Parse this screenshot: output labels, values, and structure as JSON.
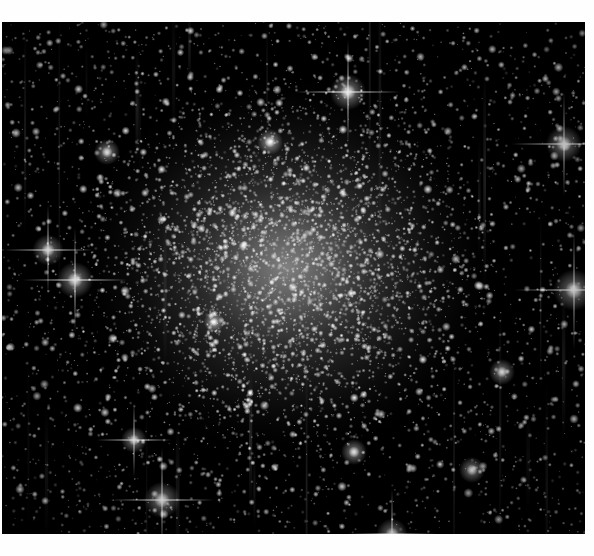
{
  "viewer": {
    "width": 594,
    "height": 556,
    "background_color": "#ffffff",
    "margin_top_px": 22,
    "margin_left_px": 2,
    "margin_right_px": 9,
    "margin_bottom_px": 22,
    "top_caption": "",
    "bottom_caption": ""
  },
  "image": {
    "title": "Globular Star Cluster Core",
    "subject": "globular-cluster",
    "palette": "monochrome-grayscale",
    "frame_x": 2,
    "frame_y": 22,
    "frame_width": 583,
    "frame_height": 512,
    "background_color": "#000000",
    "star_color": "#ffffff",
    "halo_color": "#c8c8c8",
    "core": {
      "center_x": 285,
      "center_y": 245,
      "radius_x": 215,
      "radius_y": 195,
      "peak_brightness": 0.62,
      "label": "unresolved luminous core"
    },
    "vertical_streak_count": 26,
    "star_counts": {
      "faint_field": 5200,
      "mid_bright": 1100,
      "bright": 210,
      "spiked_giants": 14
    },
    "bright_stars": [
      {
        "x": 73,
        "y": 258,
        "size": 7,
        "spikes": true,
        "label": "spiked-giant-west"
      },
      {
        "x": 46,
        "y": 228,
        "size": 6,
        "spikes": true,
        "label": "spiked-giant-northwest"
      },
      {
        "x": 346,
        "y": 70,
        "size": 7,
        "spikes": true,
        "label": "spiked-giant-north"
      },
      {
        "x": 562,
        "y": 122,
        "size": 7,
        "spikes": true,
        "label": "spiked-giant-northeast"
      },
      {
        "x": 572,
        "y": 268,
        "size": 8,
        "spikes": true,
        "label": "spiked-giant-east"
      },
      {
        "x": 160,
        "y": 478,
        "size": 7,
        "spikes": true,
        "label": "spiked-giant-southwest"
      },
      {
        "x": 390,
        "y": 512,
        "size": 6,
        "spikes": true,
        "label": "spiked-giant-south"
      },
      {
        "x": 132,
        "y": 418,
        "size": 5,
        "spikes": true,
        "label": "bright-star-lower-left"
      },
      {
        "x": 352,
        "y": 430,
        "size": 5,
        "spikes": false,
        "label": "bright-star-lower-center"
      },
      {
        "x": 470,
        "y": 448,
        "size": 5,
        "spikes": false,
        "label": "bright-star-lower-right"
      },
      {
        "x": 268,
        "y": 120,
        "size": 5,
        "spikes": false,
        "label": "bright-star-upper-center"
      },
      {
        "x": 105,
        "y": 130,
        "size": 5,
        "spikes": false,
        "label": "bright-star-upper-left"
      },
      {
        "x": 500,
        "y": 350,
        "size": 5,
        "spikes": false,
        "label": "bright-star-mid-right"
      },
      {
        "x": 212,
        "y": 300,
        "size": 4,
        "spikes": false,
        "label": "bright-star-core-region"
      }
    ],
    "render_seed": 20240917
  },
  "chart_data": {
    "type": "heatmap",
    "xlabel": "",
    "ylabel": "",
    "colormap": "grayscale",
    "note": "Radial stellar surface-density map; brightness peaks at cluster center and falls off toward the frame edges.",
    "radial_profile": {
      "radius_px": [
        0,
        30,
        60,
        90,
        120,
        150,
        180,
        210,
        250,
        300
      ],
      "relative_density": [
        1.0,
        0.94,
        0.85,
        0.74,
        0.62,
        0.5,
        0.39,
        0.29,
        0.18,
        0.1
      ]
    }
  }
}
